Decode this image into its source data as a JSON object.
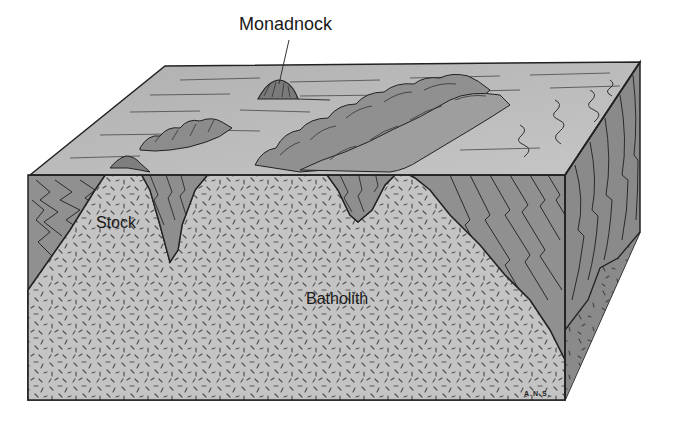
{
  "diagram": {
    "type": "geologic-block-diagram",
    "labels": {
      "monadnock": "Monadnock",
      "stock": "Stock",
      "batholith": "Batholith",
      "signature": "A.N.S."
    },
    "colors": {
      "surface": "#b4b4b4",
      "surface_light": "#c8c8c8",
      "country_rock": "#8e8e8e",
      "country_rock_dark": "#7a7a7a",
      "granite": "#c4c4c4",
      "speckle": "#555555",
      "outline": "#222222",
      "background": "#ffffff"
    },
    "features": [
      {
        "name": "Monadnock",
        "description": "isolated hill rising above eroded plain, with leader line"
      },
      {
        "name": "Stock",
        "description": "small intrusive body exposed at left"
      },
      {
        "name": "Batholith",
        "description": "large intrusive granitic body filling lower block"
      },
      {
        "name": "Country rock",
        "description": "folded layered metamorphic rock shown with wavy lines"
      },
      {
        "name": "Ridges",
        "description": "eroded hills over intrusion exposures on top surface"
      }
    ]
  }
}
